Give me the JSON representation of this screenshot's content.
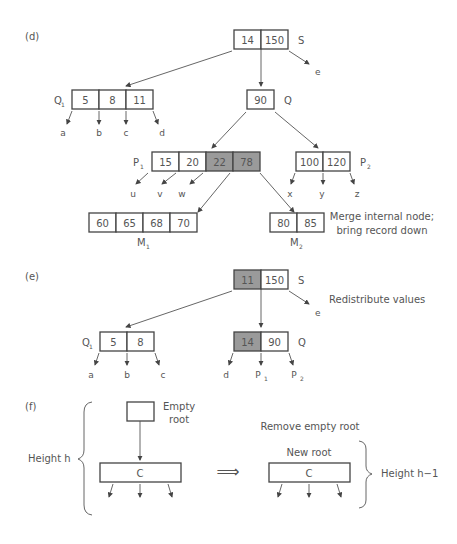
{
  "panels": {
    "d": {
      "label": "(d)",
      "S": {
        "name": "S",
        "keys": [
          "14",
          "150"
        ],
        "child_e": "e"
      },
      "Q1": {
        "name": "Q",
        "sub": "1",
        "keys": [
          "5",
          "8",
          "11"
        ],
        "children": [
          "a",
          "b",
          "c",
          "d"
        ]
      },
      "Q": {
        "name": "Q",
        "keys": [
          "90"
        ]
      },
      "P1": {
        "name": "P",
        "sub": "1",
        "keys": [
          "15",
          "20",
          "22",
          "78"
        ],
        "highlighted": [
          "22",
          "78"
        ],
        "children": [
          "u",
          "v",
          "w"
        ]
      },
      "P2": {
        "name": "P",
        "sub": "2",
        "keys": [
          "100",
          "120"
        ],
        "children": [
          "x",
          "y",
          "z"
        ]
      },
      "M1": {
        "name": "M",
        "sub": "1",
        "keys": [
          "60",
          "65",
          "68",
          "70"
        ]
      },
      "M2": {
        "name": "M",
        "sub": "2",
        "keys": [
          "80",
          "85"
        ]
      },
      "note_line1": "Merge internal node;",
      "note_line2": "bring record down"
    },
    "e": {
      "label": "(e)",
      "S": {
        "name": "S",
        "keys": [
          "11",
          "150"
        ],
        "highlighted": [
          "11"
        ],
        "child_e": "e"
      },
      "Q1": {
        "name": "Q",
        "sub": "1",
        "keys": [
          "5",
          "8"
        ],
        "children": [
          "a",
          "b",
          "c"
        ]
      },
      "Q": {
        "name": "Q",
        "keys": [
          "14",
          "90"
        ],
        "highlighted": [
          "14"
        ],
        "children": [
          "d",
          "P",
          "P"
        ],
        "child_subs": [
          "",
          "1",
          "2"
        ]
      },
      "note": "Redistribute values"
    },
    "f": {
      "label": "(f)",
      "empty_root_line1": "Empty",
      "empty_root_line2": "root",
      "node_c": "C",
      "height_left": "Height h",
      "arrow": "⟹",
      "remove_note": "Remove empty root",
      "new_root": "New root",
      "node_c2": "C",
      "height_right": "Height h−1"
    }
  },
  "colors": {
    "highlight": "#9a9a9a",
    "stroke": "#444444",
    "text": "#555555"
  }
}
